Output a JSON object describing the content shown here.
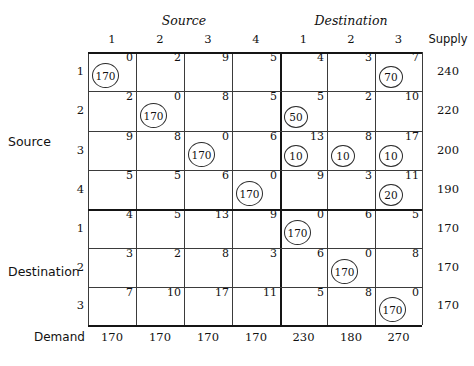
{
  "headers": {
    "source_group": "Source",
    "destination_group": "Destination",
    "supply": "Supply",
    "demand": "Demand",
    "side_source": "Source",
    "side_destination": "Destination",
    "columns": [
      "1",
      "2",
      "3",
      "4",
      "1",
      "2",
      "3"
    ]
  },
  "rows": [
    {
      "section": "source",
      "label": "1",
      "supply": "240"
    },
    {
      "section": "source",
      "label": "2",
      "supply": "220"
    },
    {
      "section": "source",
      "label": "3",
      "supply": "200"
    },
    {
      "section": "source",
      "label": "4",
      "supply": "190"
    },
    {
      "section": "destination",
      "label": "1",
      "supply": "170"
    },
    {
      "section": "destination",
      "label": "2",
      "supply": "170"
    },
    {
      "section": "destination",
      "label": "3",
      "supply": "170"
    }
  ],
  "demand": [
    "170",
    "170",
    "170",
    "170",
    "230",
    "180",
    "270"
  ],
  "costs": [
    [
      "0",
      "2",
      "9",
      "5",
      "4",
      "3",
      "7"
    ],
    [
      "2",
      "0",
      "8",
      "5",
      "5",
      "2",
      "10"
    ],
    [
      "9",
      "8",
      "0",
      "6",
      "13",
      "8",
      "17"
    ],
    [
      "5",
      "5",
      "6",
      "0",
      "9",
      "3",
      "11"
    ],
    [
      "4",
      "5",
      "13",
      "9",
      "0",
      "6",
      "5"
    ],
    [
      "3",
      "2",
      "8",
      "3",
      "6",
      "0",
      "8"
    ],
    [
      "7",
      "10",
      "17",
      "11",
      "5",
      "8",
      "0"
    ]
  ],
  "allocations": [
    [
      "170",
      "",
      "",
      "",
      "",
      "",
      "70"
    ],
    [
      "",
      "170",
      "",
      "",
      "50",
      "",
      ""
    ],
    [
      "",
      "",
      "170",
      "",
      "10",
      "10",
      "10"
    ],
    [
      "",
      "",
      "",
      "170",
      "",
      "",
      "20"
    ],
    [
      "",
      "",
      "",
      "",
      "170",
      "",
      ""
    ],
    [
      "",
      "",
      "",
      "",
      "",
      "170",
      ""
    ],
    [
      "",
      "",
      "",
      "",
      "",
      "",
      "170"
    ]
  ],
  "geometry": {
    "col_x": [
      88,
      136,
      184,
      232,
      280,
      327,
      375,
      422
    ],
    "row_y": [
      52,
      91,
      131,
      170,
      209,
      248,
      287,
      325
    ],
    "thick_col_index": 4,
    "thick_row_index": 4
  },
  "colors": {
    "line": "#3b3b3b",
    "line_thick": "#151515",
    "text": "#111111",
    "background": "#ffffff"
  }
}
